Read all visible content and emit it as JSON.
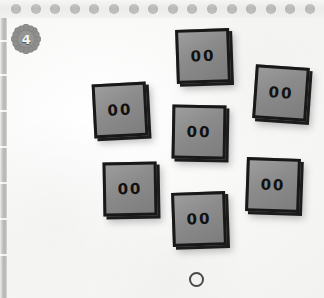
{
  "scene": {
    "name": "tile-puzzle-board",
    "background_color": "#f7f7f6"
  },
  "top_band": {
    "name": "dotted-band",
    "color": "#ececeb",
    "dot_color": "#b9b9b8",
    "dot_count": 16,
    "dots": [
      {
        "label": "dot-1"
      },
      {
        "label": "dot-2"
      },
      {
        "label": "dot-3"
      },
      {
        "label": "dot-4"
      },
      {
        "label": "dot-5"
      },
      {
        "label": "dot-6"
      },
      {
        "label": "dot-7"
      },
      {
        "label": "dot-8"
      },
      {
        "label": "dot-9"
      },
      {
        "label": "dot-10"
      },
      {
        "label": "dot-11"
      },
      {
        "label": "dot-12"
      },
      {
        "label": "dot-13"
      },
      {
        "label": "dot-14"
      },
      {
        "label": "dot-15"
      },
      {
        "label": "dot-16"
      }
    ]
  },
  "left_strip": {
    "name": "ruler-strip",
    "color": "#b4b4b3",
    "tick_offsets": [
      22,
      56,
      92,
      128,
      164,
      200,
      236
    ]
  },
  "badge": {
    "name": "gear-badge",
    "icon": "gear-icon",
    "value": "4",
    "body_color": "#8f8f8e",
    "text_color": "#f4f4f3"
  },
  "tiles": [
    {
      "id": "tile-top-center",
      "label": "00",
      "x": 176,
      "y": 29,
      "rotation": -2,
      "face_color": "#8b8b8b",
      "edge_color": "#181818"
    },
    {
      "id": "tile-mid-left",
      "label": "00",
      "x": 93,
      "y": 83,
      "rotation": -3,
      "face_color": "#8b8b8b",
      "edge_color": "#181818"
    },
    {
      "id": "tile-mid-right",
      "label": "00",
      "x": 254,
      "y": 66,
      "rotation": 4,
      "face_color": "#8b8b8b",
      "edge_color": "#181818"
    },
    {
      "id": "tile-center",
      "label": "00",
      "x": 172,
      "y": 105,
      "rotation": 1,
      "face_color": "#8b8b8b",
      "edge_color": "#181818"
    },
    {
      "id": "tile-bottom-left",
      "label": "00",
      "x": 103,
      "y": 162,
      "rotation": -1,
      "face_color": "#8b8b8b",
      "edge_color": "#181818"
    },
    {
      "id": "tile-bottom-right",
      "label": "00",
      "x": 246,
      "y": 158,
      "rotation": 2,
      "face_color": "#8b8b8b",
      "edge_color": "#181818"
    },
    {
      "id": "tile-bottom-center",
      "label": "00",
      "x": 172,
      "y": 192,
      "rotation": -2,
      "face_color": "#8b8b8b",
      "edge_color": "#181818"
    }
  ],
  "marker": {
    "name": "circle-marker",
    "shape": "circle-outline",
    "color": "#4a4a4a"
  }
}
